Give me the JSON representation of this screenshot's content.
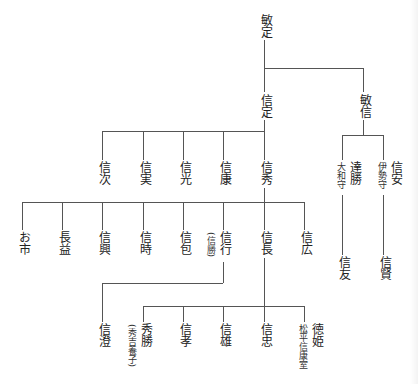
{
  "nodes": {
    "toshisada": {
      "name": "敏定"
    },
    "nobusada": {
      "name": "信定"
    },
    "toshinobu": {
      "name": "敏信"
    },
    "nobutsugu": {
      "name": "信次"
    },
    "nobuzane": {
      "name": "信実"
    },
    "nobumitsu": {
      "name": "信光"
    },
    "nobuyasu": {
      "name": "信康"
    },
    "nobuhide": {
      "name": "信秀"
    },
    "michikatsu": {
      "name": "達勝",
      "note": "大和守"
    },
    "nobuyasu2": {
      "name": "信安",
      "note": "伊勢守"
    },
    "nobutomo": {
      "name": "信友"
    },
    "nobukata": {
      "name": "信賢"
    },
    "oichi": {
      "name": "お市"
    },
    "nagamasu": {
      "name": "長益"
    },
    "nobuoki": {
      "name": "信興"
    },
    "nobutoki": {
      "name": "信時"
    },
    "nobukane": {
      "name": "信包"
    },
    "nobuyuki": {
      "name": "信行",
      "note": "(信勝)"
    },
    "nobunaga": {
      "name": "信長"
    },
    "nobuhiro": {
      "name": "信広"
    },
    "nobusumi": {
      "name": "信澄"
    },
    "hidekatsu": {
      "name": "秀勝",
      "note": "(秀吉養子)"
    },
    "nobutaka": {
      "name": "信孝"
    },
    "nobukatsu": {
      "name": "信雄"
    },
    "nobutada": {
      "name": "信忠"
    },
    "tokuhime": {
      "name": "徳姫",
      "note": "松平信康室"
    }
  }
}
